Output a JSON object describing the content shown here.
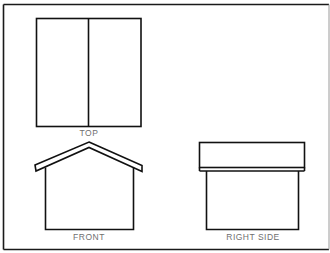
{
  "diagram": {
    "type": "orthographic-projection",
    "views": [
      {
        "id": "top",
        "label": "TOP"
      },
      {
        "id": "front",
        "label": "FRONT"
      },
      {
        "id": "right",
        "label": "RIGHT SIDE"
      }
    ]
  },
  "colors": {
    "line": "#111111",
    "label": "#6f6f6f",
    "background": "#ffffff"
  }
}
